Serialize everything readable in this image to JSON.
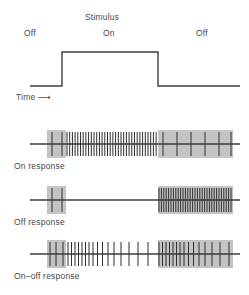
{
  "figure": {
    "title_label": "Stimulus",
    "stimulus_labels": {
      "off_left": "Off",
      "on": "On",
      "off_right": "Off"
    },
    "time_label": "Time",
    "time_arrow": "⟶",
    "panels": [
      {
        "label": "On response"
      },
      {
        "label": "Off response"
      },
      {
        "label": "On–off response"
      }
    ],
    "colors": {
      "trace": "#3d3d3d",
      "shade": "#b9b9b9",
      "spike": "#2f2f2f",
      "text": "#4a4a4a",
      "background": "#ffffff"
    }
  },
  "chart_data": {
    "type": "line",
    "title": "Stimulus",
    "xlabel": "Time",
    "ylabel": "",
    "grid": false,
    "legend": "none",
    "xlim": [
      0,
      249
    ],
    "stimulus_trace": {
      "name": "Stimulus",
      "x": [
        30,
        62,
        62,
        158,
        158,
        240
      ],
      "y": [
        86,
        86,
        52,
        52,
        86,
        86
      ],
      "segments": [
        {
          "state": "Off",
          "x_start": 30,
          "x_end": 62,
          "level": "low"
        },
        {
          "state": "On",
          "x_start": 62,
          "x_end": 158,
          "level": "high"
        },
        {
          "state": "Off",
          "x_start": 158,
          "x_end": 240,
          "level": "low"
        }
      ]
    },
    "shaded_regions": [
      {
        "name": "pre-stimulus-off",
        "x_start": 47,
        "x_end": 66
      },
      {
        "name": "post-stimulus-off",
        "x_start": 158,
        "x_end": 233
      }
    ],
    "series": [
      {
        "name": "On response",
        "baseline_y": 144,
        "description": "Sparse spikes before stimulus, sustained high-frequency firing during stimulus, sparse spikes after stimulus.",
        "spikes": [
          {
            "x": 52,
            "h": 12
          },
          {
            "x": 62,
            "h": 12
          },
          {
            "x": 67,
            "h": 12
          },
          {
            "x": 69.7,
            "h": 12
          },
          {
            "x": 72.4,
            "h": 12
          },
          {
            "x": 75.1,
            "h": 12
          },
          {
            "x": 77.8,
            "h": 12
          },
          {
            "x": 80.5,
            "h": 12
          },
          {
            "x": 83.2,
            "h": 12
          },
          {
            "x": 85.9,
            "h": 12
          },
          {
            "x": 88.6,
            "h": 12
          },
          {
            "x": 91.3,
            "h": 12
          },
          {
            "x": 94.0,
            "h": 12
          },
          {
            "x": 96.7,
            "h": 12
          },
          {
            "x": 99.4,
            "h": 12
          },
          {
            "x": 102.1,
            "h": 12
          },
          {
            "x": 104.8,
            "h": 12
          },
          {
            "x": 107.5,
            "h": 12
          },
          {
            "x": 110.2,
            "h": 12
          },
          {
            "x": 112.9,
            "h": 12
          },
          {
            "x": 115.6,
            "h": 12
          },
          {
            "x": 118.3,
            "h": 12
          },
          {
            "x": 121.0,
            "h": 12
          },
          {
            "x": 123.7,
            "h": 12
          },
          {
            "x": 126.4,
            "h": 12
          },
          {
            "x": 129.1,
            "h": 12
          },
          {
            "x": 131.8,
            "h": 12
          },
          {
            "x": 134.5,
            "h": 12
          },
          {
            "x": 137.2,
            "h": 12
          },
          {
            "x": 139.9,
            "h": 12
          },
          {
            "x": 142.6,
            "h": 12
          },
          {
            "x": 145.3,
            "h": 12
          },
          {
            "x": 148.0,
            "h": 12
          },
          {
            "x": 150.7,
            "h": 12
          },
          {
            "x": 153.4,
            "h": 12
          },
          {
            "x": 156.1,
            "h": 12
          },
          {
            "x": 163,
            "h": 12
          },
          {
            "x": 177,
            "h": 12
          },
          {
            "x": 191,
            "h": 12
          },
          {
            "x": 205,
            "h": 12
          },
          {
            "x": 219,
            "h": 12
          },
          {
            "x": 231,
            "h": 12
          }
        ]
      },
      {
        "name": "Off response",
        "baseline_y": 200,
        "description": "Sparse spikes before stimulus, silent during stimulus, burst of high-frequency firing after stimulus offset.",
        "spikes": [
          {
            "x": 52,
            "h": 12
          },
          {
            "x": 62,
            "h": 12
          },
          {
            "x": 159,
            "h": 12
          },
          {
            "x": 161.4,
            "h": 12
          },
          {
            "x": 163.8,
            "h": 12
          },
          {
            "x": 166.2,
            "h": 12
          },
          {
            "x": 168.6,
            "h": 12
          },
          {
            "x": 171.0,
            "h": 12
          },
          {
            "x": 173.4,
            "h": 12
          },
          {
            "x": 175.8,
            "h": 12
          },
          {
            "x": 178.2,
            "h": 12
          },
          {
            "x": 180.6,
            "h": 12
          },
          {
            "x": 183.0,
            "h": 12
          },
          {
            "x": 185.4,
            "h": 12
          },
          {
            "x": 187.8,
            "h": 12
          },
          {
            "x": 190.2,
            "h": 12
          },
          {
            "x": 192.6,
            "h": 12
          },
          {
            "x": 195.0,
            "h": 12
          },
          {
            "x": 197.4,
            "h": 12
          },
          {
            "x": 199.8,
            "h": 12
          },
          {
            "x": 202.2,
            "h": 12
          },
          {
            "x": 204.6,
            "h": 12
          },
          {
            "x": 207.0,
            "h": 12
          },
          {
            "x": 209.4,
            "h": 12
          },
          {
            "x": 211.8,
            "h": 12
          },
          {
            "x": 214.2,
            "h": 12
          },
          {
            "x": 216.6,
            "h": 12
          },
          {
            "x": 219.0,
            "h": 12
          },
          {
            "x": 221.4,
            "h": 12
          },
          {
            "x": 223.8,
            "h": 12
          },
          {
            "x": 226.2,
            "h": 12
          },
          {
            "x": 228.6,
            "h": 12
          },
          {
            "x": 231.0,
            "h": 12
          }
        ]
      },
      {
        "name": "On–off response",
        "baseline_y": 254,
        "description": "Sparse baseline spikes, burst at stimulus onset that adapts and thins out, then a second burst at stimulus offset.",
        "spikes": [
          {
            "x": 50,
            "h": 12
          },
          {
            "x": 56,
            "h": 12
          },
          {
            "x": 63,
            "h": 12
          },
          {
            "x": 68,
            "h": 12
          },
          {
            "x": 71.5,
            "h": 12
          },
          {
            "x": 75,
            "h": 12
          },
          {
            "x": 78.5,
            "h": 12
          },
          {
            "x": 82,
            "h": 12
          },
          {
            "x": 85.5,
            "h": 12
          },
          {
            "x": 89,
            "h": 12
          },
          {
            "x": 93,
            "h": 12
          },
          {
            "x": 97.5,
            "h": 12
          },
          {
            "x": 102.5,
            "h": 12
          },
          {
            "x": 108,
            "h": 12
          },
          {
            "x": 114,
            "h": 12
          },
          {
            "x": 121,
            "h": 12
          },
          {
            "x": 129,
            "h": 12
          },
          {
            "x": 138,
            "h": 12
          },
          {
            "x": 148,
            "h": 12
          },
          {
            "x": 159,
            "h": 12
          },
          {
            "x": 162.5,
            "h": 12
          },
          {
            "x": 166,
            "h": 12
          },
          {
            "x": 169.5,
            "h": 12
          },
          {
            "x": 173,
            "h": 12
          },
          {
            "x": 176.5,
            "h": 12
          },
          {
            "x": 180,
            "h": 12
          },
          {
            "x": 184,
            "h": 12
          },
          {
            "x": 188.5,
            "h": 12
          },
          {
            "x": 193.5,
            "h": 12
          },
          {
            "x": 199,
            "h": 12
          },
          {
            "x": 205,
            "h": 12
          },
          {
            "x": 212,
            "h": 12
          },
          {
            "x": 220,
            "h": 12
          },
          {
            "x": 229,
            "h": 12
          }
        ]
      }
    ]
  }
}
